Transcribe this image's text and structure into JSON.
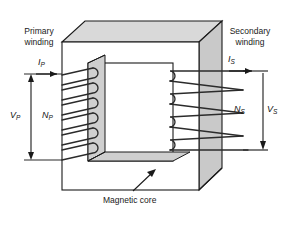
{
  "labels": {
    "primary_winding": "Primary\nwinding",
    "primary_winding_line1": "Primary",
    "primary_winding_line2": "winding",
    "secondary_winding_line1": "Secondary",
    "secondary_winding_line2": "winding",
    "magnetic_core": "Magnetic core"
  },
  "symbols": {
    "primary_current": "I",
    "primary_current_sub": "P",
    "primary_voltage": "V",
    "primary_voltage_sub": "P",
    "primary_turns": "N",
    "primary_turns_sub": "P",
    "secondary_current": "I",
    "secondary_current_sub": "S",
    "secondary_voltage": "V",
    "secondary_voltage_sub": "S",
    "secondary_turns": "N",
    "secondary_turns_sub": "S"
  },
  "windings": {
    "primary_turn_count": 6,
    "secondary_turn_count": 4
  },
  "colors": {
    "core_face_front": "#ffffff",
    "core_face_top": "#d9d9d9",
    "core_face_side": "#c9c9c9",
    "core_inner_shade": "#cfcfcf",
    "outline": "#1a1a1a",
    "wire": "#2b2b2b",
    "background": "#ffffff"
  }
}
